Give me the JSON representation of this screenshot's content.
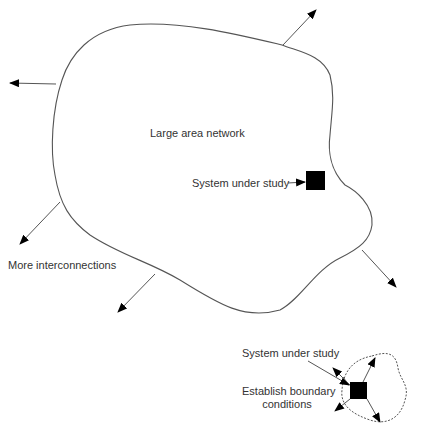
{
  "diagram": {
    "labels": {
      "network": "Large area network",
      "system_main": "System under study",
      "more": "More interconnections",
      "system_small": "System under study",
      "boundary_line1": "Establish boundary",
      "boundary_line2": "conditions"
    },
    "colors": {
      "stroke": "#555555",
      "fill": "#000000",
      "text": "#333333"
    }
  }
}
